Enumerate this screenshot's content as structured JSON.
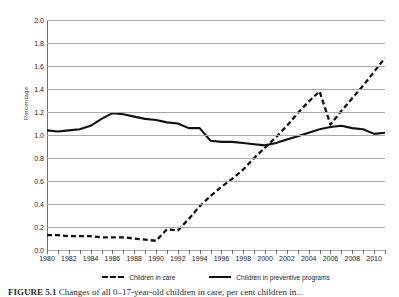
{
  "chart_data": {
    "type": "line",
    "title": "",
    "xlabel": "",
    "ylabel": "Percentage",
    "xlim": [
      1980,
      2011
    ],
    "ylim": [
      0.0,
      2.0
    ],
    "grid": true,
    "legend_position": "bottom",
    "y_ticks": [
      "2.0",
      "1.8",
      "1.6",
      "1.4",
      "1.2",
      "1.0",
      "0.8",
      "0.6",
      "0.4",
      "0.2",
      "0.0"
    ],
    "y_tick_values": [
      2.0,
      1.8,
      1.6,
      1.4,
      1.2,
      1.0,
      0.8,
      0.6,
      0.4,
      0.2,
      0.0
    ],
    "x_ticks": [
      "1980",
      "1982",
      "1984",
      "1986",
      "1988",
      "1990",
      "1992",
      "1994",
      "1996",
      "1998",
      "2000",
      "2002",
      "2004",
      "2006",
      "2008",
      "2010"
    ],
    "x_tick_values": [
      1980,
      1982,
      1984,
      1986,
      1988,
      1990,
      1992,
      1994,
      1996,
      1998,
      2000,
      2002,
      2004,
      2006,
      2008,
      2010
    ],
    "x": [
      1980,
      1981,
      1982,
      1983,
      1984,
      1985,
      1986,
      1987,
      1988,
      1989,
      1990,
      1991,
      1992,
      1993,
      1994,
      1995,
      1996,
      1997,
      1998,
      1999,
      2000,
      2001,
      2002,
      2003,
      2004,
      2005,
      2006,
      2007,
      2008,
      2009,
      2010,
      2011
    ],
    "series": [
      {
        "name": "Children in care",
        "style": "dashed",
        "color": "#111111",
        "values": [
          0.13,
          0.13,
          0.12,
          0.12,
          0.12,
          0.11,
          0.11,
          0.11,
          0.1,
          0.09,
          0.08,
          0.18,
          0.17,
          0.27,
          0.38,
          0.47,
          0.55,
          0.62,
          0.7,
          0.8,
          0.89,
          0.98,
          1.08,
          1.19,
          1.29,
          1.38,
          1.09,
          1.21,
          1.32,
          1.43,
          1.55,
          1.67
        ]
      },
      {
        "name": "Children in preventive programs",
        "style": "solid",
        "color": "#111111",
        "values": [
          1.04,
          1.03,
          1.04,
          1.05,
          1.08,
          1.14,
          1.19,
          1.18,
          1.16,
          1.14,
          1.13,
          1.11,
          1.1,
          1.06,
          1.06,
          0.95,
          0.94,
          0.94,
          0.93,
          0.92,
          0.91,
          0.93,
          0.96,
          0.99,
          1.02,
          1.05,
          1.07,
          1.08,
          1.06,
          1.05,
          1.01,
          1.02
        ]
      }
    ]
  },
  "legend": {
    "entries": [
      {
        "label": "Children in care"
      },
      {
        "label": "Children in preventive programs"
      }
    ]
  },
  "axis": {
    "y_title": "Percentage"
  },
  "caption": {
    "figure_label": "FIGURE 5.1",
    "text": "Changes of all 0–17-year-old children in care, per cent children in..."
  }
}
